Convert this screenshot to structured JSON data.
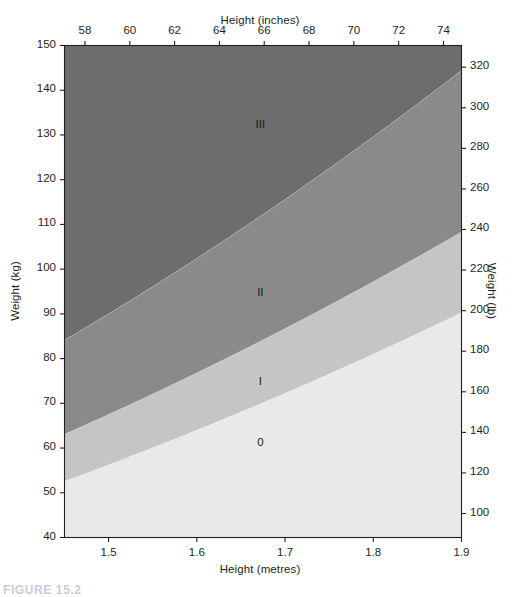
{
  "figure": {
    "caption": "FIGURE 15.2"
  },
  "chart_data": {
    "type": "area",
    "title": "",
    "xlabel": "Height (metres)",
    "ylabel": "Weight (kg)",
    "xlabel_top": "Height (inches)",
    "ylabel_right": "Weight (lb)",
    "xlim": [
      1.45,
      1.9
    ],
    "ylim": [
      40,
      150
    ],
    "xlim_top_inches": [
      57.087,
      74.803
    ],
    "ylim_right_lb": [
      88.18,
      330.69
    ],
    "grid": false,
    "legend": "none",
    "x_ticks": [
      "1.5",
      "1.6",
      "1.7",
      "1.8",
      "1.9"
    ],
    "x_tick_values": [
      1.5,
      1.6,
      1.7,
      1.8,
      1.9
    ],
    "x_ticks_top": [
      "58",
      "60",
      "62",
      "64",
      "66",
      "68",
      "70",
      "72",
      "74"
    ],
    "x_tick_values_top": [
      58,
      60,
      62,
      64,
      66,
      68,
      70,
      72,
      74
    ],
    "y_ticks": [
      "40",
      "50",
      "60",
      "70",
      "80",
      "90",
      "100",
      "110",
      "120",
      "130",
      "140",
      "150"
    ],
    "y_tick_values": [
      40,
      50,
      60,
      70,
      80,
      90,
      100,
      110,
      120,
      130,
      140,
      150
    ],
    "y_ticks_right": [
      "100",
      "120",
      "140",
      "160",
      "180",
      "200",
      "220",
      "240",
      "260",
      "280",
      "300",
      "320"
    ],
    "y_tick_values_right": [
      100,
      120,
      140,
      160,
      180,
      200,
      220,
      240,
      260,
      280,
      300,
      320
    ],
    "bands": [
      {
        "label": "0",
        "name": "normal-range",
        "bmi_range": [
          0,
          25
        ],
        "color": "#e9e9e9",
        "label_x": 1.672,
        "label_y": 61
      },
      {
        "label": "I",
        "name": "obesity-class-1",
        "bmi_range": [
          25,
          30
        ],
        "color": "#c5c5c5",
        "label_x": 1.672,
        "label_y": 74.5
      },
      {
        "label": "II",
        "name": "obesity-class-2",
        "bmi_range": [
          30,
          40
        ],
        "color": "#8a8a8a",
        "label_x": 1.672,
        "label_y": 94.5
      },
      {
        "label": "III",
        "name": "obesity-class-3",
        "bmi_range": [
          40,
          100
        ],
        "color": "#6d6d6d",
        "label_x": 1.672,
        "label_y": 132
      }
    ],
    "boundary_curves": [
      {
        "bmi": 25,
        "formula": "weight_kg = 25 * height_m^2"
      },
      {
        "bmi": 30,
        "formula": "weight_kg = 30 * height_m^2"
      },
      {
        "bmi": 40,
        "formula": "weight_kg = 40 * height_m^2"
      }
    ],
    "colors": {
      "axis": "#231f20",
      "background": "#ffffff",
      "band_0": "#e9e9e9",
      "band_I": "#c5c5c5",
      "band_II": "#8a8a8a",
      "band_III": "#6d6d6d"
    }
  }
}
